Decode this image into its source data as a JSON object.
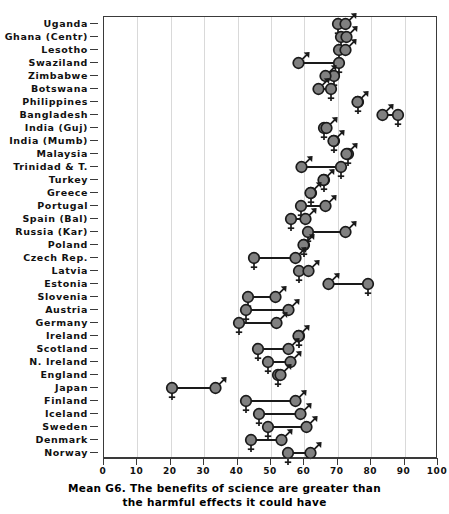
{
  "chart_data": {
    "type": "scatter",
    "title": "",
    "xlabel": "Mean G6. The benefits of science are greater than the harmful effects it could have",
    "ylabel": "",
    "xlim": [
      0,
      100
    ],
    "xticks": [
      0,
      10,
      20,
      30,
      40,
      50,
      60,
      70,
      80,
      90,
      100
    ],
    "xtick_labels": [
      "0",
      "10",
      "20",
      "30",
      "40",
      "50",
      "60",
      "70",
      "80",
      "90",
      "100"
    ],
    "grid": "vertical",
    "legend": "none",
    "series": [
      {
        "name": "Female",
        "marker": "female-symbol"
      },
      {
        "name": "Male",
        "marker": "male-symbol"
      }
    ],
    "categories": [
      "Uganda",
      "Ghana (Centr)",
      "Lesotho",
      "Swaziland",
      "Zimbabwe",
      "Botswana",
      "Philippines",
      "Bangladesh",
      "India (Guj)",
      "India (Mumb)",
      "Malaysia",
      "Trinidad & T.",
      "Turkey",
      "Greece",
      "Portugal",
      "Spain (Bal)",
      "Russia (Kar)",
      "Poland",
      "Czech Rep.",
      "Latvia",
      "Estonia",
      "Slovenia",
      "Austria",
      "Germany",
      "Ireland",
      "Scotland",
      "N. Ireland",
      "England",
      "Japan",
      "Finland",
      "Iceland",
      "Sweden",
      "Denmark",
      "Norway"
    ],
    "points": [
      {
        "category": "Uganda",
        "female": 70.0,
        "male": 73.0
      },
      {
        "category": "Ghana (Centr)",
        "female": 71.0,
        "male": 73.5
      },
      {
        "category": "Lesotho",
        "female": 70.5,
        "male": 73.0
      },
      {
        "category": "Swaziland",
        "female": 70.5,
        "male": 59.0
      },
      {
        "category": "Zimbabwe",
        "female": 69.0,
        "male": 67.0
      },
      {
        "category": "Botswana",
        "female": 68.0,
        "male": 65.0
      },
      {
        "category": "Philippines",
        "female": 76.0,
        "male": 76.5
      },
      {
        "category": "Bangladesh",
        "female": 88.0,
        "male": 84.0
      },
      {
        "category": "India (Guj)",
        "female": 66.0,
        "male": 67.5
      },
      {
        "category": "India (Mumb)",
        "female": 69.0,
        "male": 69.5
      },
      {
        "category": "Malaysia",
        "female": 73.0,
        "male": 73.5
      },
      {
        "category": "Trinidad & T.",
        "female": 71.0,
        "male": 60.0
      },
      {
        "category": "Turkey",
        "female": 66.0,
        "male": 66.5
      },
      {
        "category": "Greece",
        "female": 62.0,
        "male": 62.5
      },
      {
        "category": "Portugal",
        "female": 59.0,
        "male": 67.0
      },
      {
        "category": "Spain (Bal)",
        "female": 56.0,
        "male": 61.0
      },
      {
        "category": "Russia (Kar)",
        "female": 61.0,
        "male": 73.0
      },
      {
        "category": "Poland",
        "female": 60.0,
        "male": 60.5
      },
      {
        "category": "Czech Rep.",
        "female": 45.0,
        "male": 58.0
      },
      {
        "category": "Latvia",
        "female": 58.5,
        "male": 62.0
      },
      {
        "category": "Estonia",
        "female": 79.0,
        "male": 68.0
      },
      {
        "category": "Slovenia",
        "female": 43.0,
        "male": 52.0
      },
      {
        "category": "Austria",
        "female": 42.5,
        "male": 56.0
      },
      {
        "category": "Germany",
        "female": 40.5,
        "male": 52.5
      },
      {
        "category": "Ireland",
        "female": 58.5,
        "male": 59.0
      },
      {
        "category": "Scotland",
        "female": 46.0,
        "male": 56.0
      },
      {
        "category": "N. Ireland",
        "female": 49.0,
        "male": 56.5
      },
      {
        "category": "England",
        "female": 52.0,
        "male": 53.5
      },
      {
        "category": "Japan",
        "female": 20.5,
        "male": 34.0
      },
      {
        "category": "Finland",
        "female": 42.5,
        "male": 58.0
      },
      {
        "category": "Iceland",
        "female": 46.5,
        "male": 59.5
      },
      {
        "category": "Sweden",
        "female": 49.0,
        "male": 61.5
      },
      {
        "category": "Denmark",
        "female": 44.0,
        "male": 54.0
      },
      {
        "category": "Norway",
        "female": 55.0,
        "male": 62.5
      }
    ]
  },
  "axis": {
    "x_title_line1": "Mean G6. The benefits of science are greater than",
    "x_title_line2": "the harmful effects it could have"
  },
  "colors": {
    "marker_fill": "#808080",
    "marker_stroke": "#1a1a1a",
    "gridline": "#d9d9d9",
    "frame": "#3a3a3a",
    "text": "#111111"
  }
}
